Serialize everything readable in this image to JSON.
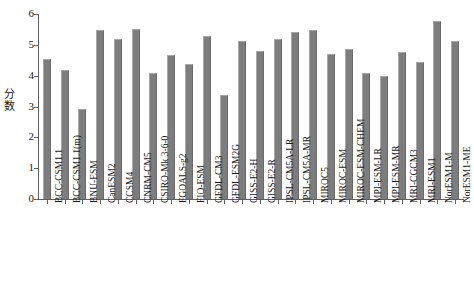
{
  "chart_data": {
    "type": "bar",
    "title": "",
    "xlabel": "",
    "ylabel": "分数",
    "ylim": [
      0,
      6
    ],
    "yticks": [
      0,
      1,
      2,
      3,
      4,
      5,
      6
    ],
    "ytick_labels": [
      "0",
      "1",
      "2",
      "3",
      "4",
      "5",
      "6"
    ],
    "grid": false,
    "legend": null,
    "bar_color": "#7d7d7d",
    "bar_edge_color": "#a8a8a8",
    "axis_color": "#5f5f5f",
    "background_color": "#ffffff",
    "categories": [
      "BCC-CSM1.1",
      "BCC-CSM1.1(m)",
      "BNU-ESM",
      "CanESM2",
      "CCSM4",
      "CNRM-CM5",
      "CSIRO-Mk 3-6-0",
      "FGOALS-g2",
      "FIO-ESM",
      "GFDL-CM3",
      "GFDL-ESM2G",
      "GISS-E2-H",
      "GISS-E2-R",
      "IPSL-CM5A-LR",
      "IPSL-CM5A-MR",
      "MIROC5",
      "MIROC-ESM",
      "MIROC-ESM-CHEM",
      "MPI-ESM-LR",
      "MPI-ESM-MR",
      "MRI-CGCM3",
      "MRI-ESM1",
      "NorESM1-M",
      "NorESM1-ME"
    ],
    "values": [
      4.55,
      4.19,
      2.92,
      5.49,
      5.19,
      5.51,
      4.09,
      4.68,
      4.38,
      5.29,
      3.37,
      5.14,
      4.8,
      5.19,
      5.43,
      5.49,
      4.7,
      4.87,
      4.09,
      4.0,
      4.78,
      4.45,
      5.77,
      5.11
    ]
  }
}
